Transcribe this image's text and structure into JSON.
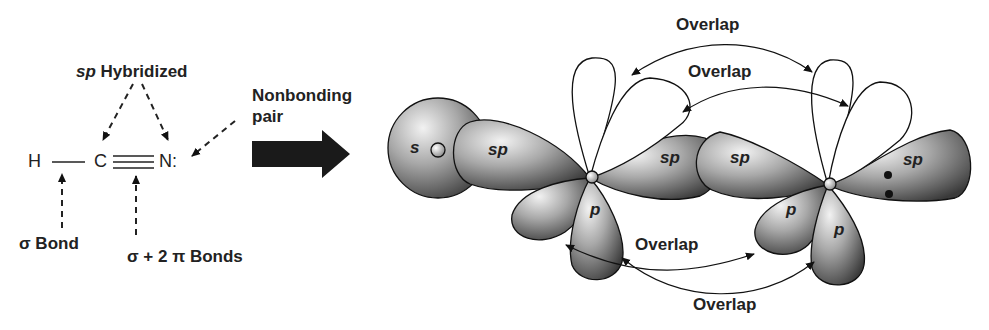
{
  "lewis": {
    "hybrid_prefix": "sp",
    "hybrid_suffix": " Hybridized",
    "atom_h": "H",
    "atom_c": "C",
    "atom_n": "N:",
    "nonbonding_line1": "Nonbonding",
    "nonbonding_line2": "pair",
    "sigma_bond": "σ Bond",
    "triple_bond": "σ + 2 π Bonds"
  },
  "orbitals": {
    "s_label": "s",
    "sp_left": "sp",
    "sp_mid_left": "sp",
    "sp_mid_right": "sp",
    "sp_right": "sp",
    "p_c_lower": "p",
    "p_n_left": "p",
    "p_n_lower": "p"
  },
  "overlaps": {
    "top_outer": "Overlap",
    "top_inner": "Overlap",
    "bottom_inner": "Overlap",
    "bottom_outer": "Overlap"
  },
  "colors": {
    "lobe_fill": "#8a8a8a",
    "outline": "#1a1a1a",
    "arrow": "#111111"
  }
}
